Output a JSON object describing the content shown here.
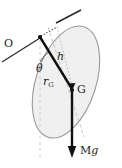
{
  "figure": {
    "caption": "Rigid body pendulum: ellipse pivoting about point O with centre of mass G",
    "width": 122,
    "height": 168,
    "background_color": "#ffffff",
    "body_fill_color": "#f0f0f0",
    "body_stroke_color": "#9a9a9a",
    "vector_color": "#111111",
    "guide_color": "#b4b4b4",
    "labels": {
      "pivot": "O",
      "perpendicular_distance": "h",
      "centroid_distance_base": "r",
      "centroid_distance_sub": "G",
      "angle": "θ",
      "centre_of_mass": "G",
      "weight_base": "M",
      "weight_italic": "g"
    },
    "elements": {
      "body_shape": "ellipse",
      "pivot_marker": "dot",
      "centre_of_mass_marker": "dot",
      "weight_vector": "downward-arrow",
      "axis_line": "dashed",
      "vertical_reference": "dashed",
      "horizontal_reference": "dotted",
      "pivot_axis_line": "solid"
    }
  }
}
